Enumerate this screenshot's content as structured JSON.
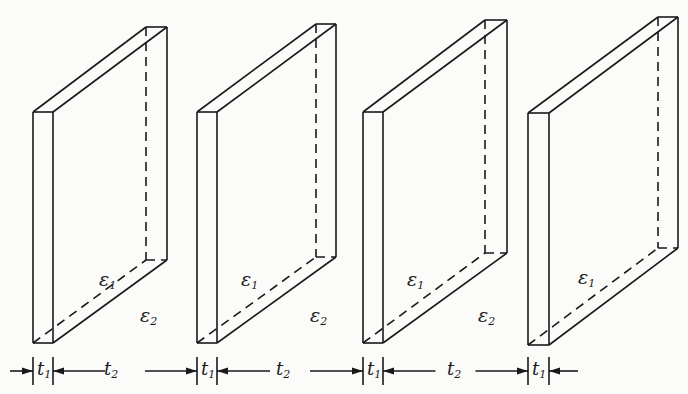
{
  "diagram": {
    "line_color": "#1a1a1a",
    "background": "#fbfbf9",
    "slabs": [
      {
        "front": {
          "x1": 33,
          "x2": 53,
          "top": 112,
          "bottom": 343
        },
        "back": {
          "x1": 146,
          "x2": 167,
          "top": 27,
          "bottom": 260
        },
        "label_base": "ε",
        "label_sub": "1",
        "label_x": 99,
        "label_y": 270
      },
      {
        "front": {
          "x1": 197,
          "x2": 217,
          "top": 112,
          "bottom": 343
        },
        "back": {
          "x1": 316,
          "x2": 336,
          "top": 24,
          "bottom": 257
        },
        "label_base": "ε",
        "label_sub": "1",
        "label_x": 241,
        "label_y": 270
      },
      {
        "front": {
          "x1": 363,
          "x2": 383,
          "top": 112,
          "bottom": 343
        },
        "back": {
          "x1": 485,
          "x2": 507,
          "top": 20,
          "bottom": 253
        },
        "label_base": "ε",
        "label_sub": "1",
        "label_x": 407,
        "label_y": 270
      },
      {
        "front": {
          "x1": 528,
          "x2": 549,
          "top": 113,
          "bottom": 345
        },
        "back": {
          "x1": 658,
          "x2": 678,
          "top": 17,
          "bottom": 248
        },
        "label_base": "ε",
        "label_sub": "1",
        "label_x": 578,
        "label_y": 268
      }
    ],
    "gap_labels": [
      {
        "base": "ε",
        "sub": "2",
        "x": 140,
        "y": 306
      },
      {
        "base": "ε",
        "sub": "2",
        "x": 310,
        "y": 306
      },
      {
        "base": "ε",
        "sub": "2",
        "x": 478,
        "y": 306
      }
    ],
    "dimension_y": 371,
    "dimensions": [
      {
        "base": "t",
        "sub": "1",
        "x": 37
      },
      {
        "base": "t",
        "sub": "2",
        "x": 104
      },
      {
        "base": "t",
        "sub": "1",
        "x": 201
      },
      {
        "base": "t",
        "sub": "2",
        "x": 276
      },
      {
        "base": "t",
        "sub": "1",
        "x": 367
      },
      {
        "base": "t",
        "sub": "2",
        "x": 447
      },
      {
        "base": "t",
        "sub": "1",
        "x": 532
      }
    ]
  }
}
